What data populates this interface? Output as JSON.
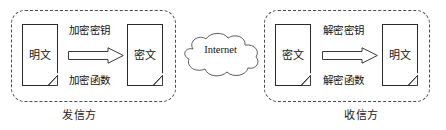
{
  "diagram": {
    "background_color": "#ffffff",
    "stroke_color": "#2b2b2b",
    "dashed_border_color": "#4a4a4a"
  },
  "sender": {
    "caption": "发信方",
    "input_document": {
      "label": "明文",
      "icon": "document-icon"
    },
    "output_document": {
      "label": "密文",
      "icon": "document-icon"
    },
    "key_label": "加密密钥",
    "function_label": "加密函数",
    "arrow": "right-block-arrow-icon"
  },
  "network": {
    "cloud_label": "Internet",
    "icon": "cloud-icon"
  },
  "receiver": {
    "caption": "收信方",
    "input_document": {
      "label": "密文",
      "icon": "document-icon"
    },
    "output_document": {
      "label": "明文",
      "icon": "document-icon"
    },
    "key_label": "解密密钥",
    "function_label": "解密函数",
    "arrow": "right-block-arrow-icon"
  }
}
